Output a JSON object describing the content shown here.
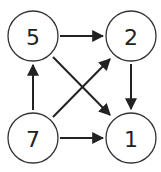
{
  "diagram": {
    "type": "directed-graph",
    "nodes": [
      {
        "id": "n5",
        "label": "5",
        "cx": 33,
        "cy": 36
      },
      {
        "id": "n2",
        "label": "2",
        "cx": 131,
        "cy": 36
      },
      {
        "id": "n7",
        "label": "7",
        "cx": 33,
        "cy": 138
      },
      {
        "id": "n1",
        "label": "1",
        "cx": 131,
        "cy": 138
      }
    ],
    "edges": [
      {
        "from": "5",
        "to": "2"
      },
      {
        "from": "5",
        "to": "1"
      },
      {
        "from": "2",
        "to": "1"
      },
      {
        "from": "7",
        "to": "5"
      },
      {
        "from": "7",
        "to": "2"
      },
      {
        "from": "7",
        "to": "1"
      }
    ],
    "radius": 25
  }
}
